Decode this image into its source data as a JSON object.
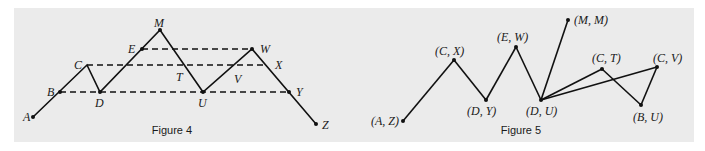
{
  "figures": [
    {
      "caption": "Figure 4",
      "caption_pos": [
        172,
        134
      ],
      "points": [
        {
          "name": "A",
          "x": 33,
          "y": 117,
          "dot": true,
          "label_x": 23,
          "label_y": 121
        },
        {
          "name": "B",
          "x": 60,
          "y": 92,
          "dot": true,
          "label_x": 47,
          "label_y": 96
        },
        {
          "name": "C",
          "x": 87,
          "y": 65,
          "dot": false,
          "label_x": 74,
          "label_y": 69
        },
        {
          "name": "D",
          "x": 100,
          "y": 92,
          "dot": true,
          "label_x": 95,
          "label_y": 107
        },
        {
          "name": "E",
          "x": 142,
          "y": 49,
          "dot": true,
          "label_x": 128,
          "label_y": 53
        },
        {
          "name": "M",
          "x": 160,
          "y": 30,
          "dot": true,
          "label_x": 154,
          "label_y": 27
        },
        {
          "name": "T",
          "x": 185,
          "y": 65,
          "dot": false,
          "label_x": 176,
          "label_y": 81
        },
        {
          "name": "U",
          "x": 203,
          "y": 92,
          "dot": true,
          "label_x": 198,
          "label_y": 107
        },
        {
          "name": "V",
          "x": 233,
          "y": 65,
          "dot": false,
          "label_x": 234,
          "label_y": 83
        },
        {
          "name": "W",
          "x": 252,
          "y": 49,
          "dot": true,
          "label_x": 260,
          "label_y": 53
        },
        {
          "name": "X",
          "x": 267,
          "y": 65,
          "dot": false,
          "label_x": 275,
          "label_y": 69
        },
        {
          "name": "Y",
          "x": 289,
          "y": 92,
          "dot": true,
          "label_x": 296,
          "label_y": 96
        },
        {
          "name": "Z",
          "x": 316,
          "y": 124,
          "dot": true,
          "label_x": 322,
          "label_y": 129
        }
      ],
      "solid_path": [
        [
          33,
          117
        ],
        [
          87,
          65
        ],
        [
          100,
          92
        ],
        [
          160,
          30
        ],
        [
          203,
          92
        ],
        [
          252,
          49
        ],
        [
          316,
          124
        ]
      ],
      "dashed_lines": [
        {
          "from": "E",
          "to": "W",
          "x1": 142,
          "y1": 49,
          "x2": 252,
          "y2": 49
        },
        {
          "from": "C",
          "to": "X",
          "x1": 87,
          "y1": 65,
          "x2": 267,
          "y2": 65
        },
        {
          "from": "B",
          "to": "Y",
          "x1": 60,
          "y1": 92,
          "x2": 289,
          "y2": 92
        }
      ]
    },
    {
      "caption": "Figure 5",
      "caption_pos": [
        521,
        134
      ],
      "points": [
        {
          "name": "(A, Z)",
          "x": 403,
          "y": 121,
          "label_x": 371,
          "label_y": 125
        },
        {
          "name": "(C, X)",
          "x": 454,
          "y": 60,
          "label_x": 435,
          "label_y": 55
        },
        {
          "name": "(D, Y)",
          "x": 486,
          "y": 100,
          "label_x": 467,
          "label_y": 115
        },
        {
          "name": "(E, W)",
          "x": 516,
          "y": 47,
          "label_x": 497,
          "label_y": 41
        },
        {
          "name": "(D, U)",
          "x": 541,
          "y": 100,
          "label_x": 526,
          "label_y": 115
        },
        {
          "name": "(M, M)",
          "x": 568,
          "y": 20,
          "label_x": 574,
          "label_y": 24
        },
        {
          "name": "(C, T)",
          "x": 602,
          "y": 69,
          "label_x": 592,
          "label_y": 62
        },
        {
          "name": "(C, V)",
          "x": 657,
          "y": 67,
          "label_x": 653,
          "label_y": 62
        },
        {
          "name": "(B, U)",
          "x": 641,
          "y": 105,
          "label_x": 633,
          "label_y": 121
        }
      ],
      "edges": [
        [
          "(A, Z)",
          "(C, X)"
        ],
        [
          "(C, X)",
          "(D, Y)"
        ],
        [
          "(D, Y)",
          "(E, W)"
        ],
        [
          "(E, W)",
          "(D, U)"
        ],
        [
          "(D, U)",
          "(M, M)"
        ],
        [
          "(D, U)",
          "(C, T)"
        ],
        [
          "(C, T)",
          "(B, U)"
        ],
        [
          "(B, U)",
          "(C, V)"
        ],
        [
          "(C, V)",
          "(D, U)"
        ]
      ]
    }
  ]
}
